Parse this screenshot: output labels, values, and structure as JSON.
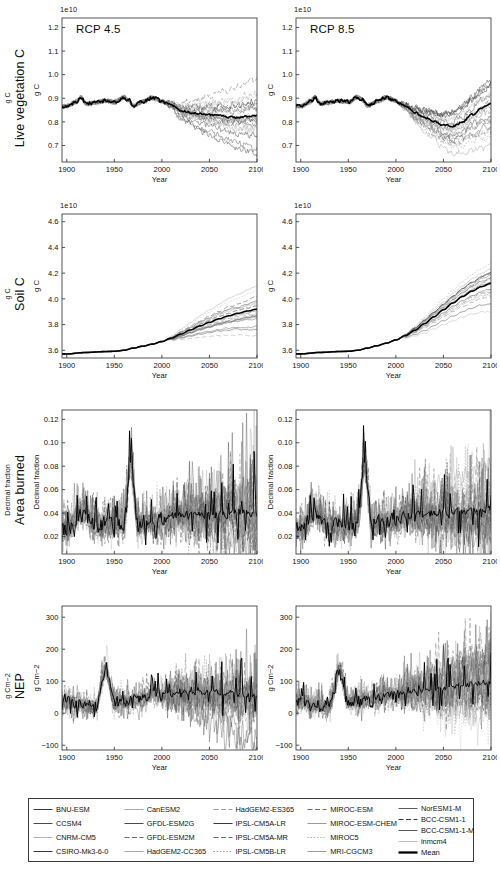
{
  "figure": {
    "width": 500,
    "height": 874,
    "background": "#ffffff",
    "scenarios": [
      "RCP 4.5",
      "RCP 8.5"
    ],
    "xlabel": "Year",
    "xticks": [
      "1900",
      "1950",
      "2000",
      "2050",
      "2100"
    ],
    "xlim": [
      1895,
      2100
    ],
    "historical_end": 2005,
    "colors": {
      "mean_line": "#000000",
      "ensemble_line": "#7a7a7a",
      "axis": "#2b2b2b",
      "text": "#111111"
    }
  },
  "rows": [
    {
      "id": "live-vegetation-c",
      "title": "Live vegetation C",
      "unit": "g C",
      "ylabel": "g C",
      "exponent": "1e10",
      "yticks": [
        "0.7",
        "0.8",
        "0.9",
        "1.0",
        "1.1",
        "1.2"
      ],
      "ytick_values": [
        0.7,
        0.8,
        0.9,
        1.0,
        1.1,
        1.2
      ],
      "ylim": [
        0.63,
        1.24
      ]
    },
    {
      "id": "soil-c",
      "title": "Soil C",
      "unit": "g C",
      "ylabel": "g C",
      "exponent": "1e10",
      "yticks": [
        "3.6",
        "3.8",
        "4.0",
        "4.2",
        "4.4",
        "4.6"
      ],
      "ytick_values": [
        3.6,
        3.8,
        4.0,
        4.2,
        4.4,
        4.6
      ],
      "ylim": [
        3.54,
        4.66
      ]
    },
    {
      "id": "area-burned",
      "title": "Area burned",
      "unit": "Decimal fraction",
      "ylabel": "Decimal fraction",
      "exponent": "",
      "yticks": [
        "0.02",
        "0.04",
        "0.06",
        "0.08",
        "0.10",
        "0.12"
      ],
      "ytick_values": [
        0.02,
        0.04,
        0.06,
        0.08,
        0.1,
        0.12
      ],
      "ylim": [
        0.005,
        0.128
      ]
    },
    {
      "id": "nep",
      "title": "NEP",
      "unit": "g Cm−2",
      "ylabel": "g Cm−2",
      "exponent": "",
      "yticks": [
        "−100",
        "0",
        "100",
        "200",
        "300"
      ],
      "ytick_values": [
        -100,
        0,
        100,
        200,
        300
      ],
      "ylim": [
        -115,
        335
      ]
    }
  ],
  "chart_data": {
    "type": "line",
    "xlabel": "Year",
    "x_range": [
      1895,
      2100
    ],
    "grid": false,
    "legend_position": "bottom",
    "panels": [
      {
        "row": "Live vegetation C",
        "scenario": "RCP 4.5",
        "ylabel": "g C",
        "exponent": "1e10",
        "ylim": [
          0.63,
          1.24
        ],
        "mean_series": {
          "name": "Mean",
          "x": [
            1900,
            1910,
            1915,
            1920,
            1930,
            1940,
            1950,
            1960,
            1965,
            1970,
            1980,
            1990,
            2000,
            2005,
            2010,
            2020,
            2030,
            2040,
            2050,
            2060,
            2070,
            2080,
            2090,
            2100
          ],
          "y": [
            0.866,
            0.885,
            0.905,
            0.878,
            0.882,
            0.889,
            0.884,
            0.905,
            0.893,
            0.868,
            0.886,
            0.902,
            0.888,
            0.878,
            0.872,
            0.848,
            0.84,
            0.834,
            0.829,
            0.826,
            0.822,
            0.818,
            0.822,
            0.825
          ]
        },
        "ensemble_spread_2100": [
          0.7,
          1.05
        ],
        "n_models": 21
      },
      {
        "row": "Live vegetation C",
        "scenario": "RCP 8.5",
        "ylabel": "g C",
        "exponent": "1e10",
        "ylim": [
          0.63,
          1.24
        ],
        "mean_series": {
          "name": "Mean",
          "x": [
            1900,
            1910,
            1915,
            1920,
            1930,
            1940,
            1950,
            1960,
            1965,
            1970,
            1980,
            1990,
            2000,
            2005,
            2010,
            2020,
            2030,
            2040,
            2050,
            2060,
            2070,
            2080,
            2090,
            2100
          ],
          "y": [
            0.866,
            0.885,
            0.905,
            0.878,
            0.882,
            0.889,
            0.884,
            0.905,
            0.893,
            0.868,
            0.886,
            0.902,
            0.888,
            0.876,
            0.866,
            0.84,
            0.82,
            0.802,
            0.786,
            0.782,
            0.8,
            0.83,
            0.858,
            0.875
          ]
        },
        "ensemble_spread_2100": [
          0.68,
          1.0
        ],
        "n_models": 21
      },
      {
        "row": "Soil C",
        "scenario": "RCP 4.5",
        "ylabel": "g C",
        "exponent": "1e10",
        "ylim": [
          3.54,
          4.66
        ],
        "mean_series": {
          "name": "Mean",
          "x": [
            1900,
            1920,
            1940,
            1950,
            1960,
            1970,
            1980,
            1990,
            2000,
            2010,
            2020,
            2030,
            2040,
            2050,
            2060,
            2070,
            2080,
            2090,
            2100
          ],
          "y": [
            3.572,
            3.583,
            3.59,
            3.592,
            3.6,
            3.617,
            3.632,
            3.648,
            3.668,
            3.695,
            3.726,
            3.758,
            3.79,
            3.818,
            3.845,
            3.868,
            3.888,
            3.905,
            3.92
          ]
        },
        "ensemble_spread_2100": [
          3.76,
          4.06
        ],
        "n_models": 21
      },
      {
        "row": "Soil C",
        "scenario": "RCP 8.5",
        "ylabel": "g C",
        "exponent": "1e10",
        "ylim": [
          3.54,
          4.66
        ],
        "mean_series": {
          "name": "Mean",
          "x": [
            1900,
            1920,
            1940,
            1950,
            1960,
            1970,
            1980,
            1990,
            2000,
            2010,
            2020,
            2030,
            2040,
            2050,
            2060,
            2070,
            2080,
            2090,
            2100
          ],
          "y": [
            3.572,
            3.583,
            3.59,
            3.592,
            3.6,
            3.617,
            3.635,
            3.655,
            3.68,
            3.714,
            3.756,
            3.806,
            3.86,
            3.915,
            3.968,
            4.018,
            4.06,
            4.095,
            4.12
          ]
        },
        "ensemble_spread_2100": [
          3.88,
          4.34
        ],
        "n_models": 21
      },
      {
        "row": "Area burned",
        "scenario": "RCP 4.5",
        "ylabel": "Decimal fraction",
        "exponent": "",
        "ylim": [
          0.005,
          0.128
        ],
        "mean_series": {
          "name": "Mean",
          "x": [
            1900,
            1915,
            1930,
            1945,
            1960,
            1967,
            1975,
            1990,
            2000,
            2010,
            2025,
            2040,
            2055,
            2070,
            2085,
            2100
          ],
          "y": [
            0.026,
            0.041,
            0.031,
            0.03,
            0.032,
            0.083,
            0.03,
            0.033,
            0.034,
            0.037,
            0.038,
            0.038,
            0.039,
            0.039,
            0.04,
            0.04
          ]
        },
        "historical_peak": {
          "year": 1967,
          "value": 0.083
        },
        "ensemble_spread_2100": [
          0.012,
          0.103
        ],
        "n_models": 21
      },
      {
        "row": "Area burned",
        "scenario": "RCP 8.5",
        "ylabel": "Decimal fraction",
        "exponent": "",
        "ylim": [
          0.005,
          0.128
        ],
        "mean_series": {
          "name": "Mean",
          "x": [
            1900,
            1915,
            1930,
            1945,
            1960,
            1967,
            1975,
            1990,
            2000,
            2010,
            2025,
            2040,
            2055,
            2070,
            2085,
            2100
          ],
          "y": [
            0.026,
            0.041,
            0.031,
            0.03,
            0.032,
            0.083,
            0.03,
            0.033,
            0.034,
            0.038,
            0.039,
            0.04,
            0.041,
            0.041,
            0.042,
            0.042
          ]
        },
        "historical_peak": {
          "year": 1967,
          "value": 0.083
        },
        "ensemble_spread_2100": [
          0.012,
          0.104
        ],
        "n_models": 21
      },
      {
        "row": "NEP",
        "scenario": "RCP 4.5",
        "ylabel": "g Cm−2",
        "exponent": "",
        "ylim": [
          -115,
          335
        ],
        "mean_series": {
          "name": "Mean",
          "x": [
            1900,
            1915,
            1930,
            1941,
            1950,
            1965,
            1980,
            1990,
            2000,
            2010,
            2025,
            2040,
            2055,
            2070,
            2085,
            2100
          ],
          "y": [
            35,
            30,
            20,
            137,
            35,
            40,
            45,
            60,
            55,
            60,
            62,
            65,
            65,
            62,
            58,
            55
          ]
        },
        "ensemble_spread_2100": [
          -60,
          280
        ],
        "n_models": 21
      },
      {
        "row": "NEP",
        "scenario": "RCP 8.5",
        "ylabel": "g Cm−2",
        "exponent": "",
        "ylim": [
          -115,
          335
        ],
        "mean_series": {
          "name": "Mean",
          "x": [
            1900,
            1915,
            1930,
            1941,
            1950,
            1965,
            1980,
            1990,
            2000,
            2010,
            2025,
            2040,
            2055,
            2070,
            2085,
            2100
          ],
          "y": [
            35,
            30,
            20,
            137,
            35,
            40,
            45,
            60,
            55,
            62,
            68,
            75,
            80,
            88,
            95,
            98
          ]
        },
        "ensemble_spread_2100": [
          -55,
          320
        ],
        "n_models": 21
      }
    ]
  },
  "legend": {
    "columns": [
      [
        {
          "label": "BNU-ESM",
          "style": "solid",
          "shade": "#3a3a3a"
        },
        {
          "label": "CCSM4",
          "style": "solid",
          "shade": "#4a4a4a"
        },
        {
          "label": "CNRM-CM5",
          "style": "solid",
          "shade": "#b4b4b4"
        },
        {
          "label": "CSIRO-Mk3-6-0",
          "style": "solid",
          "shade": "#3a3a3a"
        }
      ],
      [
        {
          "label": "CanESM2",
          "style": "solid",
          "shade": "#a8a8a8"
        },
        {
          "label": "GFDL-ESM2G",
          "style": "solid",
          "shade": "#4a4a4a"
        },
        {
          "label": "GFDL-ESM2M",
          "style": "dashed",
          "shade": "#6a6a6a"
        },
        {
          "label": "HadGEM2-CC365",
          "style": "solid",
          "shade": "#a8a8a8"
        }
      ],
      [
        {
          "label": "HadGEM2-ES365",
          "style": "dashed",
          "shade": "#9a9a9a"
        },
        {
          "label": "IPSL-CM5A-LR",
          "style": "solid",
          "shade": "#3a3a3a"
        },
        {
          "label": "IPSL-CM5A-MR",
          "style": "dashed",
          "shade": "#6a6a6a"
        },
        {
          "label": "IPSL-CM5B-LR",
          "style": "dotted",
          "shade": "#8a8a8a"
        }
      ],
      [
        {
          "label": "MIROC-ESM",
          "style": "dashed",
          "shade": "#6a6a6a"
        },
        {
          "label": "MIROC-ESM-CHEM",
          "style": "solid",
          "shade": "#9a9a9a"
        },
        {
          "label": "MIROC5",
          "style": "dotted",
          "shade": "#b0b0b0"
        },
        {
          "label": "MRI-CGCM3",
          "style": "solid",
          "shade": "#9a9a9a"
        }
      ],
      [
        {
          "label": "NorESM1-M",
          "style": "solid",
          "shade": "#5a5a5a"
        },
        {
          "label": "BCC-CSM1-1",
          "style": "dashed",
          "shade": "#3a3a3a"
        },
        {
          "label": "BCC-CSM1-1-M",
          "style": "solid",
          "shade": "#5a5a5a"
        },
        {
          "label": "inmcm4",
          "style": "solid",
          "shade": "#c0c0c0"
        },
        {
          "label": "Mean",
          "style": "mean",
          "shade": "#000000"
        }
      ]
    ]
  }
}
